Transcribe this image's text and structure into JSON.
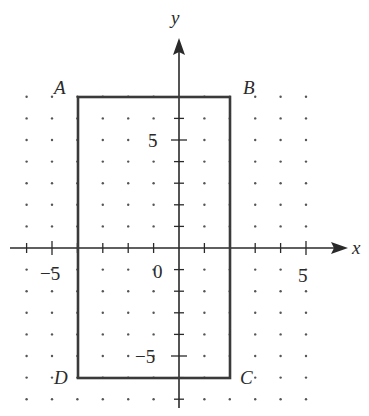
{
  "figure": {
    "axes": {
      "x_label": "x",
      "y_label": "y",
      "x_tick_labels": [
        {
          "value": -5,
          "text": "−5"
        },
        {
          "value": 0,
          "text": "0"
        },
        {
          "value": 5,
          "text": "5"
        }
      ],
      "y_tick_labels": [
        {
          "value": 5,
          "text": "5"
        },
        {
          "value": -5,
          "text": "−5"
        }
      ],
      "x_range": [
        -6,
        5
      ],
      "y_range": [
        -7,
        8
      ]
    },
    "rectangle": {
      "vertices": [
        {
          "label": "A",
          "x": -4,
          "y": 7
        },
        {
          "label": "B",
          "x": 2,
          "y": 7
        },
        {
          "label": "C",
          "x": 2,
          "y": -6
        },
        {
          "label": "D",
          "x": -4,
          "y": -6
        }
      ]
    },
    "colors": {
      "ink": "#2a2a2a",
      "dots": "#555555",
      "background": "#ffffff"
    }
  }
}
